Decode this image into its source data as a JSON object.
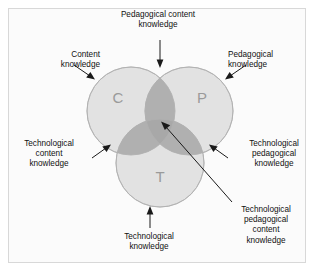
{
  "figure": {
    "background_color": "#fbfbfb",
    "frame_color": "#d8d8d8"
  },
  "colors": {
    "circle_fill": "#e2e2e2",
    "circle_stroke": "#b9b9b9",
    "pair_overlap_fill": "#b0b0b0",
    "center_overlap_fill": "#a8a8a8",
    "letter_color": "#9a9a9a",
    "text_color": "#111111",
    "arrow_color": "#1a1a1a"
  },
  "circles": [
    {
      "id": "content",
      "letter": "C",
      "cx": 131,
      "cy": 111,
      "r": 44,
      "letter_x": 118,
      "letter_y": 99
    },
    {
      "id": "pedagogical",
      "letter": "P",
      "cx": 189,
      "cy": 111,
      "r": 44,
      "letter_x": 202,
      "letter_y": 99
    },
    {
      "id": "technological",
      "letter": "T",
      "cx": 160,
      "cy": 163,
      "r": 44,
      "letter_x": 160,
      "letter_y": 177
    }
  ],
  "labels": {
    "pedagogical_content_knowledge": {
      "lines": [
        "Pedagogical content",
        "knowledge"
      ],
      "line1": "Pedagogical content",
      "line2": "knowledge"
    },
    "content_knowledge": {
      "lines": [
        "Content",
        "knowledge"
      ],
      "line1": "Content",
      "line2": "knowledge"
    },
    "pedagogical_knowledge": {
      "lines": [
        "Pedagogical",
        "knowledge"
      ],
      "line1": "Pedagogical",
      "line2": "knowledge"
    },
    "technological_content_knowledge": {
      "lines": [
        "Technological",
        "content",
        "knowledge"
      ],
      "line1": "Technological",
      "line2": "content",
      "line3": "knowledge"
    },
    "technological_pedagogical_knowledge": {
      "lines": [
        "Technological",
        "pedagogical",
        "knowledge"
      ],
      "line1": "Technological",
      "line2": "pedagogical",
      "line3": "knowledge"
    },
    "technological_knowledge": {
      "lines": [
        "Technological",
        "knowledge"
      ],
      "line1": "Technological",
      "line2": "knowledge"
    },
    "technological_pedagogical_content_knowledge": {
      "lines": [
        "Technological",
        "pedagogical",
        "content",
        "knowledge"
      ],
      "line1": "Technological",
      "line2": "pedagogical",
      "line3": "content",
      "line4": "knowledge"
    }
  }
}
